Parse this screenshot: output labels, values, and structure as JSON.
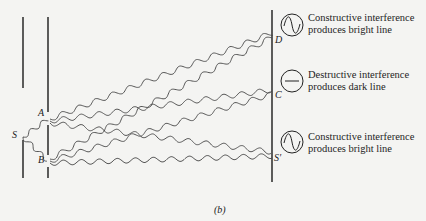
{
  "labels": {
    "source": "S",
    "slit_a": "A",
    "slit_b": "B",
    "point_d": "D",
    "point_c": "C",
    "point_s_prime": "S′"
  },
  "annotations": [
    {
      "icon": "sine-wave-icon",
      "line1": "Constructive interference",
      "line2": "produces bright line"
    },
    {
      "icon": "flat-line-icon",
      "line1": "Destructive interference",
      "line2": "produces dark line"
    },
    {
      "icon": "sine-wave-icon",
      "line1": "Constructive interference",
      "line2": "produces bright line"
    }
  ],
  "caption": "(b)",
  "colors": {
    "ink": "#1a1a1a",
    "wave": "#444444",
    "background": "#f4f4f2"
  }
}
